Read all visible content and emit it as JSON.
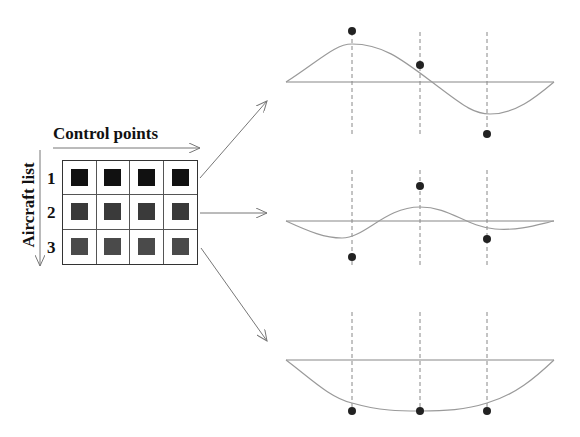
{
  "diagram": {
    "title": "Control points",
    "y_label": "Aircraft list",
    "row_labels": [
      "1",
      "2",
      "3"
    ],
    "colors": {
      "row1": "#111111",
      "row2": "#3a3a3a",
      "row3": "#4a4a4a",
      "curve": "#9a9a9a",
      "axis": "#888888",
      "dashed": "#888888",
      "dot": "#222222",
      "arrow": "#777777"
    },
    "grid": {
      "rows": 3,
      "cols": 4
    },
    "plots": [
      {
        "name": "aircraft-1-plot",
        "axis_y": 82,
        "dash_top": 32,
        "dash_bottom": 135,
        "control_points": [
          [
            352,
            31
          ],
          [
            420,
            65
          ],
          [
            487,
            134
          ]
        ],
        "curve": "M286,82 C320,60 335,44 352,44 C385,44 405,62 440,88 C465,107 475,114 490,114 C515,114 535,98 554,82"
      },
      {
        "name": "aircraft-2-plot",
        "axis_y": 221,
        "dash_top": 170,
        "dash_bottom": 268,
        "control_points": [
          [
            352,
            257
          ],
          [
            420,
            186
          ],
          [
            487,
            239
          ]
        ],
        "curve": "M286,221 C310,232 325,238 342,238 C365,238 385,207 420,207 C450,207 465,226 495,229 C520,231 540,224 554,221"
      },
      {
        "name": "aircraft-3-plot",
        "axis_y": 360,
        "dash_top": 312,
        "dash_bottom": 410,
        "control_points": [
          [
            352,
            411
          ],
          [
            420,
            411
          ],
          [
            487,
            411
          ]
        ],
        "curve": "M286,360 C310,378 330,398 352,403 C380,411 400,411 420,411 C445,411 465,410 487,403 C515,395 535,378 554,360"
      }
    ],
    "arrows": [
      {
        "name": "arrow-to-plot-1",
        "from": [
          200,
          178
        ],
        "to": [
          267,
          101
        ]
      },
      {
        "name": "arrow-to-plot-2",
        "from": [
          200,
          213
        ],
        "to": [
          267,
          213
        ]
      },
      {
        "name": "arrow-to-plot-3",
        "from": [
          201,
          248
        ],
        "to": [
          267,
          341
        ]
      }
    ]
  }
}
